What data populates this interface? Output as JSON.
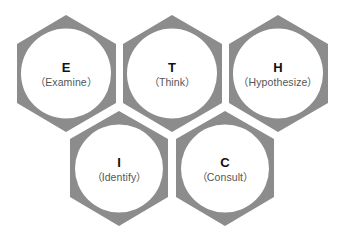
{
  "colors": {
    "hexagon_fill": "#8c8c8c",
    "circle_fill": "#ffffff",
    "letter_color": "#111111",
    "label_color": "#555555"
  },
  "nodes": [
    {
      "letter": "E",
      "label": "（Examine）"
    },
    {
      "letter": "T",
      "label": "（Think）"
    },
    {
      "letter": "H",
      "label": "（Hypothesize）"
    },
    {
      "letter": "I",
      "label": "（Identify）"
    },
    {
      "letter": "C",
      "label": "（Consult）"
    }
  ]
}
